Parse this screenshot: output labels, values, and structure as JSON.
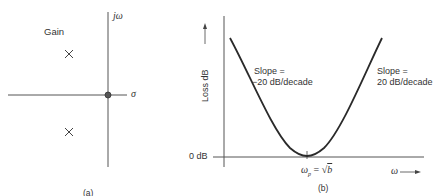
{
  "panel_a": {
    "caption": "(a)",
    "gain_label": "Gain",
    "vertical_axis_label": "jω",
    "horizontal_axis_label": "σ",
    "poles": [
      {
        "symbol": "×",
        "position": "upper-left"
      },
      {
        "symbol": "×",
        "position": "lower-left"
      }
    ],
    "zero": {
      "symbol": "●",
      "position": "origin"
    }
  },
  "panel_b": {
    "caption": "(b)",
    "y_axis_label": "Loss dB ⟶",
    "x_axis_label": "ω ⟶",
    "zero_db_label": "0 dB",
    "min_point_label_lhs": "ω",
    "min_point_label_sub": "p",
    "min_point_label_rhs": " = √",
    "min_point_label_var": "b",
    "left_slope_line1": "Slope =",
    "left_slope_line2": "−20 dB/decade",
    "right_slope_line1": "Slope =",
    "right_slope_line2": "20 dB/decade"
  },
  "colors": {
    "line": "#2a2a2a",
    "axis": "#555555"
  }
}
